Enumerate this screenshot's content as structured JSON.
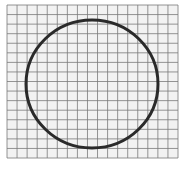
{
  "figure": {
    "grid": {
      "x": 7,
      "y": 5,
      "width": 171,
      "height": 153,
      "cols": 17,
      "rows": 16,
      "line_color": "#7a7a7a",
      "background": "#f2f2f2"
    },
    "circle": {
      "cx": 92,
      "cy": 84,
      "rx": 66,
      "ry": 64,
      "stroke": "#2a2a2a",
      "stroke_width": 3
    },
    "caption": ""
  }
}
